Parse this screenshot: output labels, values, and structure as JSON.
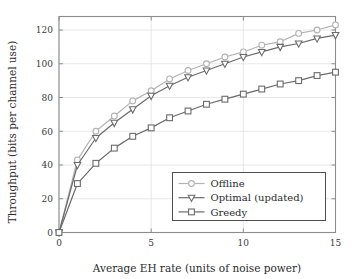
{
  "chart_data": {
    "type": "line",
    "title": "",
    "xlabel": "Average EH rate (units of noise power)",
    "ylabel": "Throughput (bits per channel use)",
    "xlim": [
      0,
      15
    ],
    "ylim": [
      0,
      128
    ],
    "xticks": [
      0,
      5,
      10,
      15
    ],
    "yticks": [
      0,
      20,
      40,
      60,
      80,
      100,
      120
    ],
    "xtick_labels": [
      "0",
      "5",
      "10",
      "15"
    ],
    "ytick_labels": [
      "0",
      "20",
      "40",
      "60",
      "80",
      "100",
      "120"
    ],
    "grid": true,
    "legend_position": "lower right",
    "x": [
      0,
      1,
      2,
      3,
      4,
      5,
      6,
      7,
      8,
      9,
      10,
      11,
      12,
      13,
      14,
      15
    ],
    "series": [
      {
        "name": "Offline",
        "marker": "circle",
        "color": "#b3b3b3",
        "values": [
          0,
          43,
          60,
          69,
          78,
          84,
          91,
          96,
          100,
          104,
          107,
          111,
          113,
          118,
          120,
          123
        ]
      },
      {
        "name": "Optimal (updated)",
        "marker": "triangle-down",
        "color": "#6b6b6b",
        "values": [
          0,
          40,
          56,
          65,
          73,
          81,
          87,
          92,
          96,
          100,
          104,
          107,
          110,
          112,
          115,
          117
        ]
      },
      {
        "name": "Greedy",
        "marker": "square",
        "color": "#6b6b6b",
        "values": [
          0,
          29,
          41,
          50,
          57,
          62,
          68,
          72,
          76,
          79,
          82,
          85,
          88,
          90,
          93,
          95
        ]
      }
    ]
  },
  "axes": {
    "x_title": "Average EH rate (units of noise power)",
    "y_title": "Throughput (bits per channel use)"
  },
  "legend": {
    "entries": [
      {
        "label": "Offline"
      },
      {
        "label": "Optimal (updated)"
      },
      {
        "label": "Greedy"
      }
    ]
  },
  "colors": {
    "offline": "#b3b3b3",
    "optimal": "#6b6b6b",
    "greedy": "#6b6b6b",
    "axis": "#8c8c8c",
    "grid": "#e2e2e2",
    "text": "#2b2b2b",
    "background": "#ffffff"
  }
}
